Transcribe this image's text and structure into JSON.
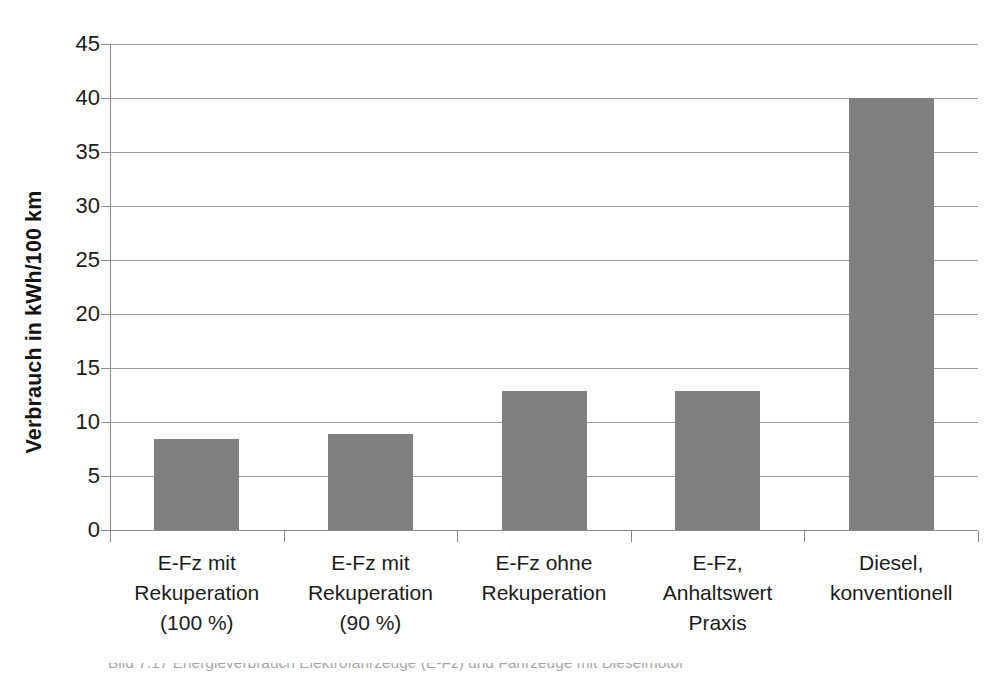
{
  "chart_data": {
    "type": "bar",
    "title": "",
    "subtitle": "",
    "xlabel": "",
    "ylabel": "Verbrauch in kWh/100 km",
    "ylim": [
      0,
      45
    ],
    "ytick_step": 5,
    "yticks": [
      "45",
      "40",
      "35",
      "30",
      "25",
      "20",
      "15",
      "10",
      "5",
      "0"
    ],
    "grid": true,
    "legend": "none",
    "bar_color": "#808080",
    "categories": [
      "E-Fz mit Rekuperation (100 %)",
      "E-Fz mit Rekuperation (90 %)",
      "E-Fz ohne Rekuperation",
      "E-Fz, Anhaltswert Praxis",
      "Diesel, konventionell"
    ],
    "category_lines": [
      [
        "E-Fz mit",
        "Rekuperation",
        "(100 %)"
      ],
      [
        "E-Fz mit",
        "Rekuperation",
        "(90 %)"
      ],
      [
        "E-Fz ohne",
        "Rekuperation"
      ],
      [
        "E-Fz,",
        "Anhaltswert",
        "Praxis"
      ],
      [
        "Diesel,",
        "konventionell"
      ]
    ],
    "values": [
      8.4,
      8.9,
      12.9,
      12.9,
      40.0
    ]
  },
  "caption": {
    "text": "Bild 7.17  Energieverbrauch Elektrofahrzeuge (E-Fz) und Fahrzeuge mit Dieselmotor"
  }
}
